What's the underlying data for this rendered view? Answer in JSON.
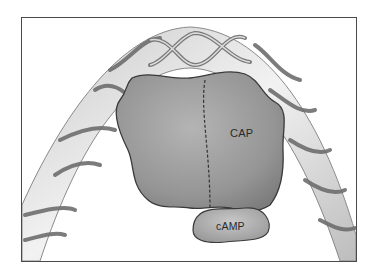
{
  "figure": {
    "labels": {
      "protein": "CAP",
      "ligand": "cAMP"
    },
    "colors": {
      "frame": "#4a4a4a",
      "protein_fill": "#9a9a9a",
      "protein_outline": "#3a3a3a",
      "dna_tube": "#d6d6d6",
      "dna_strand": "#7a7a7a",
      "camp_fill": "#b3b3b3"
    }
  }
}
